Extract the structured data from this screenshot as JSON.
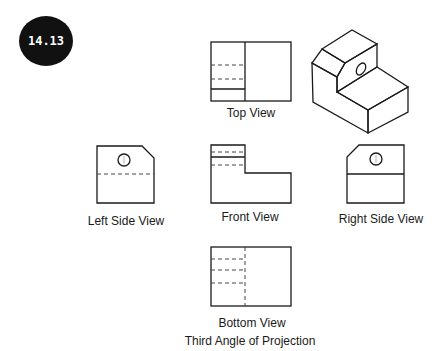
{
  "badge": {
    "label": "14.13",
    "fill": "#111111",
    "text_color": "#ffffff"
  },
  "views": {
    "top": {
      "label": "Top View"
    },
    "front": {
      "label": "Front View"
    },
    "left": {
      "label": "Left Side View"
    },
    "right": {
      "label": "Right Side View"
    },
    "bottom": {
      "label": "Bottom View"
    },
    "isometric": {
      "label": ""
    }
  },
  "caption": "Third Angle of Projection",
  "colors": {
    "line": "#1a1a1a",
    "hidden_line": "#444444",
    "background": "#ffffff"
  }
}
